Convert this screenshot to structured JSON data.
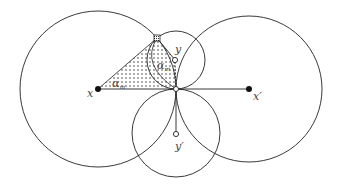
{
  "diagram": {
    "labels": {
      "x": "x",
      "x_prime": "x′",
      "y": "y",
      "y_prime": "y′",
      "alpha_m": "α",
      "alpha_m_sub": "m",
      "alpha_inner": "α",
      "alpha_inner_sub": "m"
    },
    "colors": {
      "stroke": "#222222",
      "shade_dot": "#333333",
      "background": "#ffffff"
    }
  }
}
